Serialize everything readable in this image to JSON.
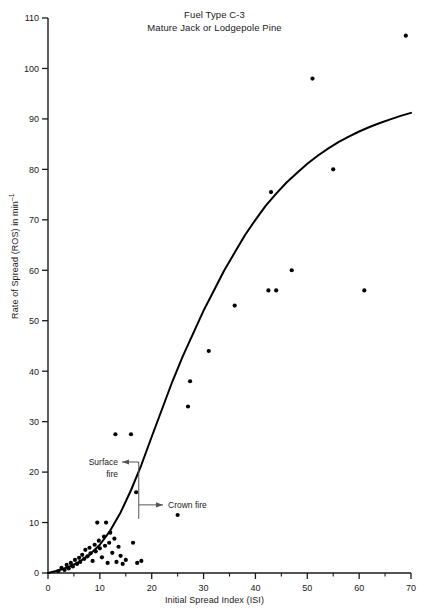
{
  "chart_data": {
    "type": "scatter",
    "title": "Fuel Type C-3",
    "subtitle": "Mature Jack or Lodgepole Pine",
    "xlabel": "Initial Spread Index (ISI)",
    "ylabel_text": "Rate of Spread (ROS) in min",
    "ylabel_exponent": "–1",
    "xlim": [
      0,
      70
    ],
    "ylim": [
      0,
      110
    ],
    "xticks": [
      0,
      10,
      20,
      30,
      40,
      50,
      60,
      70
    ],
    "xminorticks": [
      5,
      15,
      25,
      35,
      45,
      55,
      65
    ],
    "yticks": [
      0,
      10,
      20,
      30,
      40,
      50,
      60,
      70,
      80,
      90,
      100,
      110
    ],
    "grid": false,
    "legend": "none",
    "axis_color": "#1a1a1a",
    "marker_color": "#000000",
    "curve_color": "#000000",
    "annotations": [
      {
        "name": "surface-fire",
        "lines": [
          "Surface",
          "fire"
        ],
        "arrow": "left",
        "x_value": 17.5,
        "y_value": 22.0
      },
      {
        "name": "crown-fire",
        "lines": [
          "Crown fire"
        ],
        "arrow": "right",
        "x_value": 17.5,
        "y_value": 13.5
      }
    ],
    "points": [
      {
        "x": 2.0,
        "y": 0.4
      },
      {
        "x": 2.6,
        "y": 1.0
      },
      {
        "x": 3.2,
        "y": 0.6
      },
      {
        "x": 3.6,
        "y": 1.6
      },
      {
        "x": 4.0,
        "y": 0.9
      },
      {
        "x": 4.4,
        "y": 2.0
      },
      {
        "x": 4.8,
        "y": 1.3
      },
      {
        "x": 5.2,
        "y": 2.6
      },
      {
        "x": 5.6,
        "y": 1.8
      },
      {
        "x": 6.0,
        "y": 3.0
      },
      {
        "x": 6.2,
        "y": 2.2
      },
      {
        "x": 6.6,
        "y": 3.6
      },
      {
        "x": 7.0,
        "y": 2.8
      },
      {
        "x": 7.2,
        "y": 4.6
      },
      {
        "x": 7.6,
        "y": 3.3
      },
      {
        "x": 8.0,
        "y": 5.0
      },
      {
        "x": 8.2,
        "y": 3.9
      },
      {
        "x": 8.6,
        "y": 2.4
      },
      {
        "x": 9.0,
        "y": 5.6
      },
      {
        "x": 9.2,
        "y": 4.3
      },
      {
        "x": 9.5,
        "y": 10.0
      },
      {
        "x": 9.8,
        "y": 6.4
      },
      {
        "x": 10.0,
        "y": 4.9
      },
      {
        "x": 10.4,
        "y": 3.1
      },
      {
        "x": 10.8,
        "y": 7.2
      },
      {
        "x": 11.0,
        "y": 5.4
      },
      {
        "x": 11.2,
        "y": 10.0
      },
      {
        "x": 11.5,
        "y": 2.0
      },
      {
        "x": 11.8,
        "y": 6.0
      },
      {
        "x": 12.0,
        "y": 8.0
      },
      {
        "x": 12.4,
        "y": 4.0
      },
      {
        "x": 12.8,
        "y": 6.8
      },
      {
        "x": 13.0,
        "y": 27.5
      },
      {
        "x": 13.2,
        "y": 2.2
      },
      {
        "x": 13.6,
        "y": 5.2
      },
      {
        "x": 14.0,
        "y": 3.4
      },
      {
        "x": 14.4,
        "y": 1.8
      },
      {
        "x": 15.0,
        "y": 2.6
      },
      {
        "x": 16.0,
        "y": 27.5
      },
      {
        "x": 16.4,
        "y": 6.0
      },
      {
        "x": 17.0,
        "y": 16.0
      },
      {
        "x": 17.2,
        "y": 2.0
      },
      {
        "x": 18.0,
        "y": 2.4
      },
      {
        "x": 25.0,
        "y": 11.5
      },
      {
        "x": 27.0,
        "y": 33.0
      },
      {
        "x": 27.4,
        "y": 38.0
      },
      {
        "x": 31.0,
        "y": 44.0
      },
      {
        "x": 36.0,
        "y": 53.0
      },
      {
        "x": 42.5,
        "y": 56.0
      },
      {
        "x": 44.0,
        "y": 56.0
      },
      {
        "x": 43.0,
        "y": 75.5
      },
      {
        "x": 47.0,
        "y": 60.0
      },
      {
        "x": 51.0,
        "y": 98.0
      },
      {
        "x": 55.0,
        "y": 80.0
      },
      {
        "x": 61.0,
        "y": 56.0
      },
      {
        "x": 69.0,
        "y": 106.5
      }
    ],
    "curve": [
      {
        "x": 0.0,
        "y": 0.0
      },
      {
        "x": 2.0,
        "y": 0.5
      },
      {
        "x": 4.0,
        "y": 1.2
      },
      {
        "x": 6.0,
        "y": 2.2
      },
      {
        "x": 8.0,
        "y": 3.6
      },
      {
        "x": 10.0,
        "y": 5.6
      },
      {
        "x": 12.0,
        "y": 8.4
      },
      {
        "x": 14.0,
        "y": 12.0
      },
      {
        "x": 16.0,
        "y": 16.4
      },
      {
        "x": 18.0,
        "y": 21.4
      },
      {
        "x": 20.0,
        "y": 27.0
      },
      {
        "x": 22.0,
        "y": 32.5
      },
      {
        "x": 24.0,
        "y": 38.0
      },
      {
        "x": 26.0,
        "y": 43.0
      },
      {
        "x": 28.0,
        "y": 47.5
      },
      {
        "x": 30.0,
        "y": 52.0
      },
      {
        "x": 32.0,
        "y": 56.0
      },
      {
        "x": 34.0,
        "y": 60.0
      },
      {
        "x": 36.0,
        "y": 63.5
      },
      {
        "x": 38.0,
        "y": 67.0
      },
      {
        "x": 40.0,
        "y": 70.0
      },
      {
        "x": 42.0,
        "y": 72.8
      },
      {
        "x": 44.0,
        "y": 75.2
      },
      {
        "x": 46.0,
        "y": 77.4
      },
      {
        "x": 48.0,
        "y": 79.3
      },
      {
        "x": 50.0,
        "y": 81.1
      },
      {
        "x": 52.0,
        "y": 82.7
      },
      {
        "x": 54.0,
        "y": 84.1
      },
      {
        "x": 56.0,
        "y": 85.4
      },
      {
        "x": 58.0,
        "y": 86.5
      },
      {
        "x": 60.0,
        "y": 87.5
      },
      {
        "x": 62.0,
        "y": 88.4
      },
      {
        "x": 64.0,
        "y": 89.2
      },
      {
        "x": 66.0,
        "y": 89.9
      },
      {
        "x": 68.0,
        "y": 90.6
      },
      {
        "x": 70.0,
        "y": 91.2
      }
    ]
  }
}
